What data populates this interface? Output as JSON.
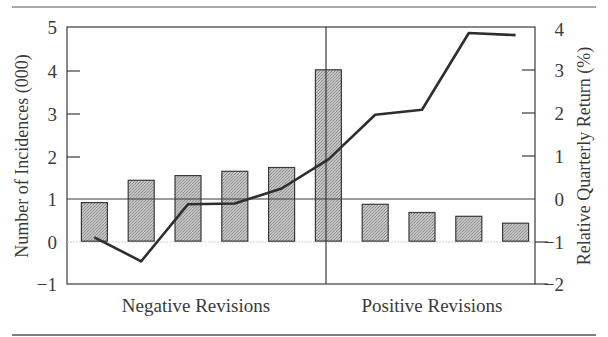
{
  "chart_data": {
    "type": "bar+line",
    "title": "",
    "categories": [
      "1",
      "2",
      "3",
      "4",
      "5",
      "6",
      "7",
      "8",
      "9",
      "10"
    ],
    "group_labels": [
      {
        "label": "Negative Revisions",
        "categories": [
          "1",
          "2",
          "3",
          "4",
          "5",
          "6"
        ]
      },
      {
        "label": "Positive Revisions",
        "categories": [
          "7",
          "8",
          "9",
          "10"
        ]
      }
    ],
    "series": [
      {
        "name": "Number of Incidences (000)",
        "type": "bar",
        "axis": "left",
        "values": [
          0.9,
          1.42,
          1.53,
          1.63,
          1.72,
          4.0,
          0.86,
          0.67,
          0.58,
          0.42
        ]
      },
      {
        "name": "Relative Quarterly Return (%)",
        "type": "line",
        "axis": "right",
        "values": [
          -0.91,
          -1.47,
          -0.14,
          -0.12,
          0.23,
          0.91,
          1.95,
          2.07,
          3.86,
          3.81
        ]
      }
    ],
    "ylabel": "Number of Incidences (000)",
    "ylabel_right": "Relative Quarterly Return (%)",
    "ylim": [
      -1,
      5
    ],
    "ylim_right": [
      -2,
      4
    ],
    "yticks": [
      "5",
      "4",
      "3",
      "2",
      "1",
      "0",
      "−1"
    ],
    "yticks_right": [
      "4",
      "3",
      "2",
      "1",
      "0",
      "−1",
      "−2"
    ],
    "xlabel": "",
    "grid": false,
    "legend": "none",
    "divider_between": [
      "6",
      "7"
    ],
    "colors": {
      "bar_fill": "#b8b8b8",
      "bar_stroke": "#3a3a3a",
      "line": "#2e2e2e",
      "frame": "#3a3a3a",
      "zero_line": "#cccccc"
    }
  }
}
